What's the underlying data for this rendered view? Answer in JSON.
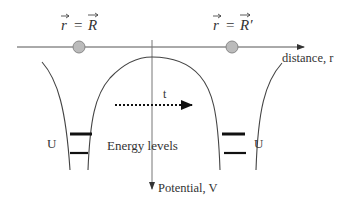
{
  "diagram": {
    "labels": {
      "left_position": "r = R",
      "left_lhs": "r",
      "left_eq": "=",
      "left_rhs": "R",
      "right_lhs": "r",
      "right_eq": "=",
      "right_rhs": "R′",
      "x_axis": "distance, r",
      "y_axis": "Potential, V",
      "time": "t",
      "energy_levels": "Energy levels",
      "left_well_label": "U",
      "right_well_label": "U"
    },
    "colors": {
      "line": "#555555",
      "curve": "#444444",
      "level": "#111111",
      "particle_fill": "#bbbbbb",
      "particle_stroke": "#888888"
    }
  }
}
